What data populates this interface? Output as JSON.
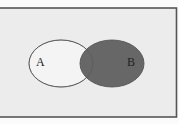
{
  "diagram": {
    "type": "venn",
    "sets": [
      {
        "id": "A",
        "label": "A",
        "shaded": false
      },
      {
        "id": "B",
        "label": "B",
        "shaded": true
      }
    ],
    "shaded_region": "B",
    "colors": {
      "page_background": "#fbfbfb",
      "universe_background": "#ececec",
      "universe_border": "#555555",
      "set_outline": "#555555",
      "set_unshaded_fill": "#f4f4f4",
      "set_shaded_fill": "#676767",
      "label_color": "#222222"
    }
  }
}
